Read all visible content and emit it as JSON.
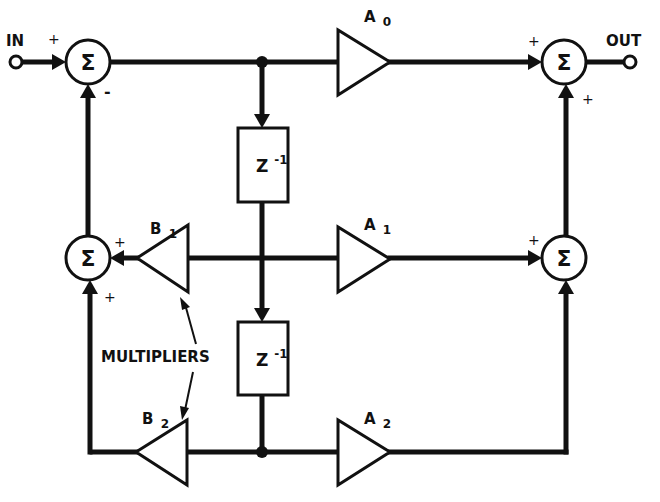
{
  "diagram": {
    "type": "block-diagram",
    "colors": {
      "ink": "#111111",
      "background": "#ffffff"
    },
    "terminals": {
      "input": "IN",
      "output": "OUT"
    },
    "summers": {
      "symbol": "Σ",
      "input_summer": {
        "signs": {
          "left": "+",
          "bottom": "-"
        }
      },
      "feedback_summer": {
        "signs": {
          "right": "+",
          "bottom": "+"
        }
      },
      "output_summer": {
        "signs": {
          "left": "+",
          "bottom": "+"
        }
      },
      "feedforward_summer": {
        "signs": {
          "left": "+"
        }
      }
    },
    "delays": [
      {
        "label": "Z",
        "exp": "-1"
      },
      {
        "label": "Z",
        "exp": "-1"
      }
    ],
    "multipliers": {
      "A0": {
        "base": "A",
        "sub": "0"
      },
      "A1": {
        "base": "A",
        "sub": "1"
      },
      "A2": {
        "base": "A",
        "sub": "2"
      },
      "B1": {
        "base": "B",
        "sub": "1"
      },
      "B2": {
        "base": "B",
        "sub": "2"
      }
    },
    "annotation": "MULTIPLIERS"
  }
}
